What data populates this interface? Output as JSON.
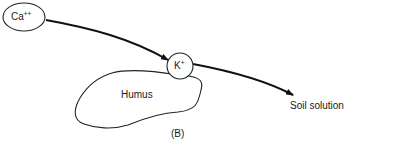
{
  "diagram": {
    "nodes": {
      "calcium": {
        "base": "Ca",
        "charge": "++"
      },
      "potassium": {
        "base": "K",
        "charge": "+"
      },
      "humus": {
        "label": "Humus"
      },
      "soil_solution": {
        "label": "Soil solution"
      }
    },
    "edges": [
      {
        "from": "calcium",
        "to": "potassium"
      },
      {
        "from": "potassium",
        "to": "soil_solution"
      }
    ],
    "panel_label": "(B)"
  }
}
